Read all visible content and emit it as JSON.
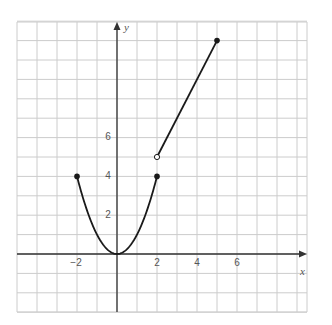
{
  "chart_data": {
    "type": "line",
    "title": "",
    "xlabel": "x",
    "ylabel": "y",
    "xlim": [
      -5,
      9.5
    ],
    "ylim": [
      -3,
      12
    ],
    "grid": true,
    "x_tick_labels": [
      "-2",
      "2",
      "4",
      "6"
    ],
    "y_tick_labels": [
      "2",
      "4",
      "6"
    ],
    "series": [
      {
        "name": "parabola segment y = x^2",
        "function": "y = x^2, -2 <= x <= 2",
        "points": [
          [
            -2,
            4
          ],
          [
            -1.5,
            2.25
          ],
          [
            -1,
            1
          ],
          [
            -0.5,
            0.25
          ],
          [
            0,
            0
          ],
          [
            0.5,
            0.25
          ],
          [
            1,
            1
          ],
          [
            1.5,
            2.25
          ],
          [
            2,
            4
          ]
        ],
        "endpoints": [
          {
            "x": -2,
            "y": 4,
            "style": "closed"
          },
          {
            "x": 2,
            "y": 4,
            "style": "closed"
          }
        ]
      },
      {
        "name": "line segment y = 2x + 1",
        "function": "y = 2x + 1, 2 < x <= 5",
        "points": [
          [
            2,
            5
          ],
          [
            5,
            11
          ]
        ],
        "endpoints": [
          {
            "x": 2,
            "y": 5,
            "style": "open"
          },
          {
            "x": 5,
            "y": 11,
            "style": "closed"
          }
        ]
      }
    ],
    "colors": {
      "curve": "#1a1a1a",
      "grid": "#cccccc",
      "axis": "#333333",
      "label": "#555555"
    }
  },
  "labels": {
    "x_axis": "x",
    "y_axis": "y",
    "xticks": {
      "m2": "−2",
      "p2": "2",
      "p4": "4",
      "p6": "6"
    },
    "yticks": {
      "p2": "2",
      "p4": "4",
      "p6": "6"
    }
  }
}
